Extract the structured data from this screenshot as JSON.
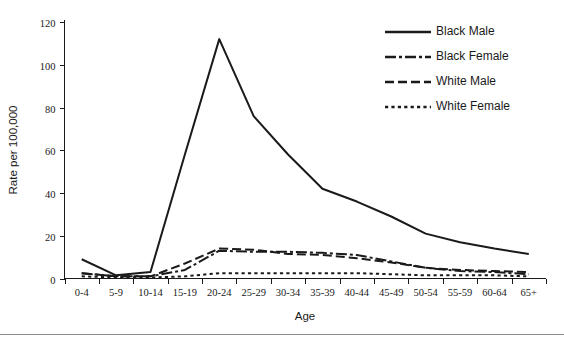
{
  "chart_data": {
    "type": "line",
    "title": "",
    "xlabel": "Age",
    "ylabel": "Rate per 100,000",
    "categories": [
      "0-4",
      "5-9",
      "10-14",
      "15-19",
      "20-24",
      "25-29",
      "30-34",
      "35-39",
      "40-44",
      "45-49",
      "50-54",
      "55-59",
      "60-64",
      "65+"
    ],
    "ylim": [
      0,
      120
    ],
    "yticks": [
      0,
      20,
      40,
      60,
      80,
      100,
      120
    ],
    "ytick_labels": [
      "0",
      "20",
      "40",
      "60",
      "80",
      "100",
      "120"
    ],
    "grid": false,
    "legend_position": "top-right",
    "series": [
      {
        "name": "Black Male",
        "style": "solid",
        "color": "#1a1a1a",
        "values": [
          9,
          1.5,
          3,
          58,
          112,
          76,
          58,
          42,
          36,
          29,
          21,
          17,
          14,
          11.5
        ]
      },
      {
        "name": "Black Female",
        "style": "dash-dot",
        "color": "#1a1a1a",
        "values": [
          2.5,
          1,
          1,
          4,
          13,
          12.5,
          12.5,
          12,
          11,
          8,
          5,
          3.5,
          3,
          2
        ]
      },
      {
        "name": "White Male",
        "style": "dashed",
        "color": "#1a1a1a",
        "values": [
          2.5,
          1,
          1,
          7,
          14,
          13.5,
          11.5,
          11,
          9.5,
          7.5,
          5,
          4,
          3.5,
          3
        ]
      },
      {
        "name": "White Female",
        "style": "dotted",
        "color": "#1a1a1a",
        "values": [
          1,
          0.5,
          0.5,
          1,
          2.5,
          2.5,
          2.5,
          2.5,
          2.5,
          2,
          1.5,
          1.5,
          1.5,
          1
        ]
      }
    ]
  },
  "legend": {
    "items": [
      {
        "label": "Black Male"
      },
      {
        "label": "Black Female"
      },
      {
        "label": "White Male"
      },
      {
        "label": "White Female"
      }
    ]
  }
}
